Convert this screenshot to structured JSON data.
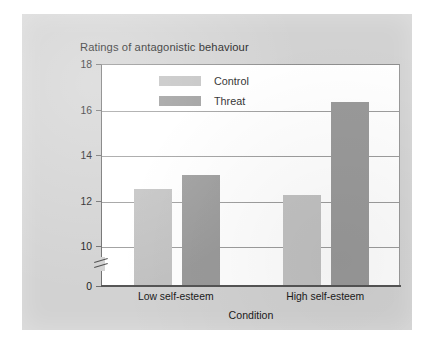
{
  "chart_data": {
    "type": "bar",
    "title": "Ratings of antagonistic behaviour",
    "xlabel": "Condition",
    "ylabel": "",
    "categories": [
      "Low self-esteem",
      "High self-esteem"
    ],
    "series": [
      {
        "name": "Control",
        "color": "#c2c2c2",
        "values": [
          12.5,
          12.25
        ]
      },
      {
        "name": "Threat",
        "color": "#9a9a9a",
        "values": [
          13.1,
          16.35
        ]
      }
    ],
    "ylim": [
      0,
      18
    ],
    "yticks": [
      0,
      10,
      12,
      14,
      16,
      18
    ],
    "ytick_labels": [
      "0",
      "10",
      "12",
      "14",
      "16",
      "18"
    ],
    "axis_break": true,
    "axis_break_between": [
      0,
      10
    ],
    "grid": true,
    "grid_axis": "y",
    "legend_position": "top-center",
    "legend_entries": [
      "Control",
      "Threat"
    ]
  },
  "figure": {
    "panel_color": "#d2d2d2",
    "plot_background": "#ffffff",
    "gridline_color": "#9d9d9d",
    "axis_color": "#555555",
    "text_color": "#1b1b1b"
  }
}
